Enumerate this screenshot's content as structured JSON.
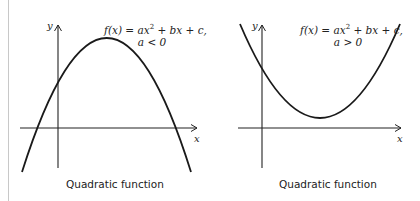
{
  "panels": [
    {
      "id": "concave-down",
      "formula": {
        "line1_prefix": "f(x) = ax",
        "line1_exp": "2",
        "line1_suffix": " + bx + c,",
        "line2": "a < 0"
      },
      "axis_labels": {
        "x": "x",
        "y": "y"
      },
      "caption": "Quadratic function",
      "curve_color": "#1a1a1a",
      "axis_color": "#222222"
    },
    {
      "id": "concave-up",
      "formula": {
        "line1_prefix": "f(x) = ax",
        "line1_exp": "2",
        "line1_suffix": " + bx + c,",
        "line2": "a > 0"
      },
      "axis_labels": {
        "x": "x",
        "y": "y"
      },
      "caption": "Quadratic function",
      "curve_color": "#1a1a1a",
      "axis_color": "#222222"
    }
  ]
}
